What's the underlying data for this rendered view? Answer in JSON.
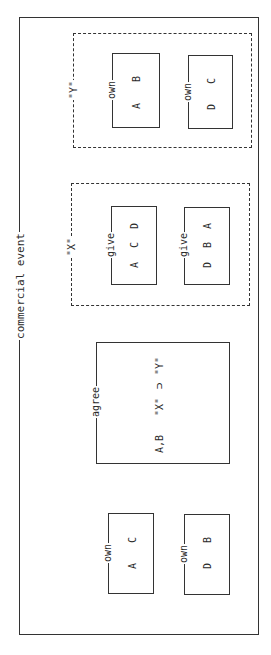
{
  "diagram": {
    "orientation": "rotated-90-ccw",
    "outer": {
      "label": "commercial event"
    },
    "groups": [
      {
        "id": "Y",
        "label": "\"Y\"",
        "boxes": [
          {
            "relation": "own",
            "items": [
              "A",
              "B"
            ]
          },
          {
            "relation": "own",
            "items": [
              "D",
              "C"
            ]
          }
        ]
      },
      {
        "id": "X",
        "label": "\"X\"",
        "boxes": [
          {
            "relation": "give",
            "items": [
              "A",
              "C",
              "D"
            ]
          },
          {
            "relation": "give",
            "items": [
              "D",
              "B",
              "A"
            ]
          }
        ]
      }
    ],
    "agree": {
      "relation": "agree",
      "parties": "A,B",
      "x": "\"X\"",
      "op": "⊃",
      "y": "\"Y\""
    },
    "initial": [
      {
        "relation": "own",
        "items": [
          "A",
          "C"
        ]
      },
      {
        "relation": "own",
        "items": [
          "D",
          "B"
        ]
      }
    ]
  }
}
